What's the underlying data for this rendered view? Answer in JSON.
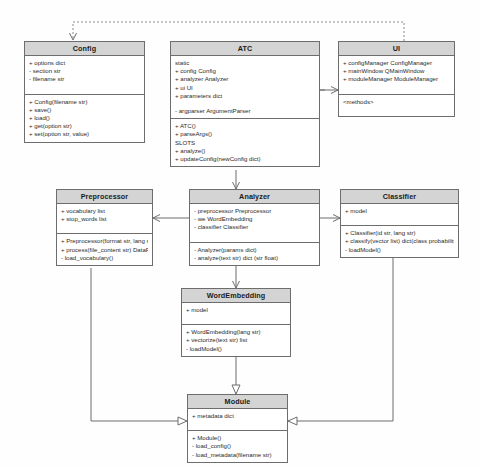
{
  "diagram": {
    "type": "uml-class-diagram",
    "title": "",
    "background_color": "#fefefe",
    "class_header_color": "#d4d4d4",
    "class_body_color": "#ffffff",
    "border_color": "#6d6d6d",
    "text_color": "#2b2b2b"
  },
  "classes": {
    "config": {
      "name": "Config",
      "attributes": [
        "+ options   dict",
        "- section   str",
        "- filename  str"
      ],
      "methods": [
        "+ Config(filename str)",
        "+ save()",
        "+ load()",
        "+ get(option str)",
        "+ set(option str, value)"
      ]
    },
    "atc": {
      "name": "ATC",
      "attributes": [
        "static",
        "+ config   Config",
        "+ analyzer   Analyzer",
        "+ ui   UI",
        "+ parameters   dict"
      ],
      "attributes2": [
        "- argparser  ArgumentParser"
      ],
      "methods": [
        "+ ATC()",
        "+ parseArgs()",
        "SLOTS",
        "+ analyze()",
        "+ updateConfig(newConfig dict)"
      ]
    },
    "ui": {
      "name": "UI",
      "attributes": [
        "+ configManager  ConfigManager",
        "+ mainWindow  QMainWindow",
        "+ moduleManager  ModuleManager"
      ],
      "methods": [
        "<methods>"
      ]
    },
    "preprocessor": {
      "name": "Preprocessor",
      "attributes": [
        "+ vocabulary   list",
        "+ stop_words   list"
      ],
      "methods": [
        "+ Preprocessor(format str, lang str)",
        "+ process(file_content str)   DataFrame",
        "- load_vocabulary()"
      ]
    },
    "analyzer": {
      "name": "Analyzer",
      "attributes": [
        "- preprocessor   Preprocessor",
        "- we   WordEmbedding",
        "- classifier   Classifier"
      ],
      "methods": [
        "- Analyzer(params dict)",
        "- analyze(text str)   dict (str  float)"
      ]
    },
    "classifier": {
      "name": "Classifier",
      "attributes": [
        "+ model"
      ],
      "methods": [
        "+ Classifier(id str, lang str)",
        "+ classify(vector list)   dict(class  probability)",
        "- loadModel()"
      ]
    },
    "wordembedding": {
      "name": "WordEmbedding",
      "attributes": [
        "+ model"
      ],
      "methods": [
        "+ WordEmbedding(lang str)",
        "+ vectorize(text str)   list",
        "- loadModel()"
      ]
    },
    "module": {
      "name": "Module",
      "attributes": [
        "+ metadata   dict"
      ],
      "methods": [
        "+ Module()",
        "- load_config()",
        "- load_metadata(filename str)"
      ]
    }
  },
  "relationships": [
    {
      "id": "ui-config-dependency",
      "from": "UI",
      "to": "Config",
      "style": "dashed",
      "arrow": "open"
    },
    {
      "id": "atc-config-association",
      "from": "ATC",
      "to": "Config",
      "style": "solid",
      "arrow": "open"
    },
    {
      "id": "atc-ui-association",
      "from": "ATC",
      "to": "UI",
      "style": "solid",
      "arrow": "open"
    },
    {
      "id": "atc-analyzer-association",
      "from": "ATC",
      "to": "Analyzer",
      "style": "solid",
      "arrow": "open"
    },
    {
      "id": "analyzer-preprocessor-association",
      "from": "Analyzer",
      "to": "Preprocessor",
      "style": "solid",
      "arrow": "open"
    },
    {
      "id": "analyzer-classifier-association",
      "from": "Analyzer",
      "to": "Classifier",
      "style": "solid",
      "arrow": "open"
    },
    {
      "id": "analyzer-wordembedding-association",
      "from": "Analyzer",
      "to": "WordEmbedding",
      "style": "solid",
      "arrow": "open"
    },
    {
      "id": "wordembedding-module-inheritance",
      "from": "WordEmbedding",
      "to": "Module",
      "style": "solid",
      "arrow": "triangle"
    },
    {
      "id": "preprocessor-module-inheritance",
      "from": "Preprocessor",
      "to": "Module",
      "style": "solid",
      "arrow": "triangle"
    },
    {
      "id": "classifier-module-inheritance",
      "from": "Classifier",
      "to": "Module",
      "style": "solid",
      "arrow": "triangle"
    }
  ]
}
